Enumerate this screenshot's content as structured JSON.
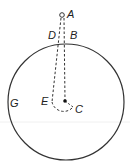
{
  "diagram": {
    "labels": {
      "A": "A",
      "B": "B",
      "C": "C",
      "D": "D",
      "E": "E",
      "G": "G"
    },
    "colors": {
      "stroke": "#333333",
      "background": "#ffffff"
    }
  }
}
